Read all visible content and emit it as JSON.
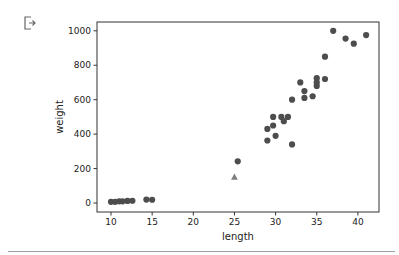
{
  "cell": {
    "output_icon": "output-redirect-icon"
  },
  "chart_data": {
    "type": "scatter",
    "title": "",
    "xlabel": "length",
    "ylabel": "weight",
    "xlim": [
      8.5,
      42.2
    ],
    "ylim": [
      -50,
      1050
    ],
    "xticks": [
      10,
      15,
      20,
      25,
      30,
      35,
      40
    ],
    "yticks": [
      0,
      200,
      400,
      600,
      800,
      1000
    ],
    "grid": false,
    "legend": null,
    "series": [
      {
        "name": "fish",
        "marker": "o",
        "color": "#4d4d4d",
        "points": [
          [
            10.0,
            7
          ],
          [
            10.5,
            7
          ],
          [
            11.0,
            10
          ],
          [
            11.4,
            10
          ],
          [
            12.0,
            12
          ],
          [
            12.6,
            13
          ],
          [
            14.3,
            20
          ],
          [
            15.0,
            19
          ],
          [
            25.4,
            242
          ],
          [
            29.0,
            363
          ],
          [
            29.0,
            430
          ],
          [
            29.7,
            450
          ],
          [
            29.7,
            500
          ],
          [
            30.0,
            390
          ],
          [
            30.7,
            500
          ],
          [
            31.0,
            475
          ],
          [
            31.5,
            500
          ],
          [
            32.0,
            340
          ],
          [
            32.0,
            600
          ],
          [
            33.0,
            700
          ],
          [
            33.5,
            610
          ],
          [
            33.5,
            650
          ],
          [
            34.5,
            620
          ],
          [
            35.0,
            680
          ],
          [
            35.0,
            700
          ],
          [
            35.0,
            725
          ],
          [
            36.0,
            720
          ],
          [
            36.0,
            850
          ],
          [
            37.0,
            1000
          ],
          [
            38.5,
            955
          ],
          [
            39.5,
            925
          ],
          [
            41.0,
            975
          ]
        ]
      },
      {
        "name": "new sample",
        "marker": "^",
        "color": "#7f7f7f",
        "points": [
          [
            25.0,
            150
          ]
        ]
      }
    ]
  }
}
